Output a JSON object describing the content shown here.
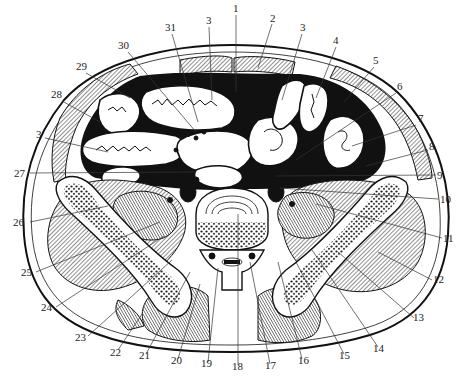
{
  "figure": {
    "labels": [
      {
        "id": "l1",
        "text": "1",
        "x": 233,
        "y": 12
      },
      {
        "id": "l2",
        "text": "2",
        "x": 270,
        "y": 22
      },
      {
        "id": "l3a",
        "text": "3",
        "x": 206,
        "y": 24
      },
      {
        "id": "l3b",
        "text": "3",
        "x": 300,
        "y": 31
      },
      {
        "id": "l31",
        "text": "31",
        "x": 167,
        "y": 31
      },
      {
        "id": "l30",
        "text": "30",
        "x": 121,
        "y": 49
      },
      {
        "id": "l4",
        "text": "4",
        "x": 333,
        "y": 44
      },
      {
        "id": "l5",
        "text": "5",
        "x": 373,
        "y": 64
      },
      {
        "id": "l29",
        "text": "29",
        "x": 79,
        "y": 70
      },
      {
        "id": "l28",
        "text": "28",
        "x": 54,
        "y": 98
      },
      {
        "id": "l6",
        "text": "6",
        "x": 397,
        "y": 90
      },
      {
        "id": "l7",
        "text": "7",
        "x": 418,
        "y": 122
      },
      {
        "id": "l3c",
        "text": "3",
        "x": 37,
        "y": 135
      },
      {
        "id": "l8",
        "text": "8",
        "x": 429,
        "y": 148
      },
      {
        "id": "l27",
        "text": "27",
        "x": 16,
        "y": 176
      },
      {
        "id": "l9",
        "text": "9",
        "x": 437,
        "y": 178
      },
      {
        "id": "l10",
        "text": "10",
        "x": 440,
        "y": 202
      },
      {
        "id": "l26",
        "text": "26",
        "x": 14,
        "y": 225
      },
      {
        "id": "l11",
        "text": "11",
        "x": 444,
        "y": 241
      },
      {
        "id": "l25",
        "text": "25",
        "x": 22,
        "y": 275
      },
      {
        "id": "l12",
        "text": "12",
        "x": 434,
        "y": 283
      },
      {
        "id": "l24",
        "text": "24",
        "x": 42,
        "y": 310
      },
      {
        "id": "l13",
        "text": "13",
        "x": 414,
        "y": 321
      },
      {
        "id": "l23",
        "text": "23",
        "x": 77,
        "y": 340
      },
      {
        "id": "l14",
        "text": "14",
        "x": 375,
        "y": 351
      },
      {
        "id": "l22",
        "text": "22",
        "x": 112,
        "y": 355
      },
      {
        "id": "l15",
        "text": "15",
        "x": 341,
        "y": 358
      },
      {
        "id": "l21",
        "text": "21",
        "x": 141,
        "y": 358
      },
      {
        "id": "l16",
        "text": "16",
        "x": 300,
        "y": 363
      },
      {
        "id": "l20",
        "text": "20",
        "x": 174,
        "y": 363
      },
      {
        "id": "l19",
        "text": "19",
        "x": 204,
        "y": 366
      },
      {
        "id": "l17",
        "text": "17",
        "x": 268,
        "y": 368
      },
      {
        "id": "l18",
        "text": "18",
        "x": 235,
        "y": 369
      }
    ]
  }
}
